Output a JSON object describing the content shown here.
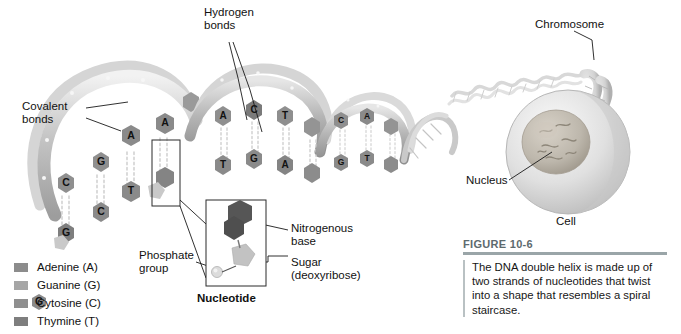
{
  "figure": {
    "id": "FIGURE 10-6",
    "caption": "The DNA double helix is made up of two strands of nucleotides that twist into a shape that resembles a spiral staircase.",
    "title_color": "#5d6a6e",
    "rule_color": "#9aa5a8"
  },
  "callouts": {
    "hydrogen_bonds": "Hydrogen\nbonds",
    "covalent_bonds": "Covalent\nbonds",
    "chromosome": "Chromosome",
    "nucleus": "Nucleus",
    "cell": "Cell",
    "nitrogenous_base": "Nitrogenous\nbase",
    "phosphate_group": "Phosphate\ngroup",
    "sugar": "Sugar\n(deoxyribose)",
    "nucleotide": "Nucleotide"
  },
  "legend": {
    "items": [
      {
        "label": "Adenine (A)",
        "color": "#8c8c8c"
      },
      {
        "label": "Guanine (G)",
        "color": "#a6a6a6"
      },
      {
        "label": "Cytosine (C)",
        "color": "#8f8f8f"
      },
      {
        "label": "Thymine (T)",
        "color": "#7e7e7e"
      }
    ]
  },
  "helix": {
    "base_letters": [
      "C",
      "G",
      "A",
      "T",
      "C",
      "G",
      "A",
      "T",
      "G",
      "C",
      "A",
      "T",
      "C",
      "G",
      "T",
      "A",
      "C",
      "G",
      "A",
      "T"
    ],
    "pairs": [
      {
        "left": "C",
        "right": "G"
      },
      {
        "left": "G",
        "right": "C"
      },
      {
        "left": "A",
        "right": "T"
      },
      {
        "left": "T",
        "right": "A"
      }
    ],
    "backbone_color": "#bdbdbd",
    "base_color": "#8a8a8a",
    "base_dark_color": "#5f5f5f",
    "bond_color": "#d0d0d0"
  },
  "nucleotide_inset": {
    "base_color": "#565656",
    "sugar_color": "#c2c2c2",
    "phosphate_color": "#d8d8d8",
    "box_color": "#3a3a3a"
  },
  "cell": {
    "membrane_color": "#cfcfcf",
    "cytoplasm_color": "#e3e3e3",
    "nucleus_color": "#b9b4ad",
    "chromosome_color": "#d6d6d6"
  }
}
